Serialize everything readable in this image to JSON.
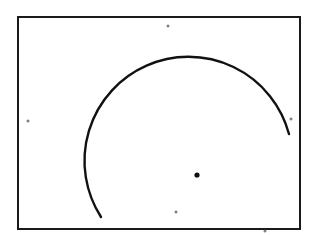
{
  "diagram": {
    "type": "circular-arc-figure",
    "frame": {
      "x": 18,
      "y": 17,
      "width": 282,
      "height": 212,
      "stroke": "#1a1a1a",
      "stroke_width": 2
    },
    "arc": {
      "center": {
        "x": 197,
        "y": 175
      },
      "radius": 104,
      "start": {
        "x": 101,
        "y": 217
      },
      "end": {
        "x": 289,
        "y": 134
      },
      "stroke": "#111111",
      "stroke_width": 2.4
    },
    "center_point": {
      "x": 197,
      "y": 175,
      "r": 2.6,
      "color": "#111111"
    },
    "marks": [
      {
        "name": "top-mark",
        "x": 168,
        "y": 26
      },
      {
        "name": "left-mark",
        "x": 28,
        "y": 121
      },
      {
        "name": "right-mark",
        "x": 291,
        "y": 119
      },
      {
        "name": "bottom-mark",
        "x": 176,
        "y": 212
      },
      {
        "name": "outside-mark",
        "x": 265,
        "y": 231
      }
    ],
    "mark_color": "#555555"
  }
}
